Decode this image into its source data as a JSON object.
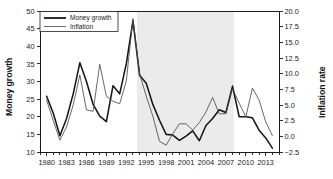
{
  "chart_data": {
    "type": "line",
    "title": "",
    "xlabel": "",
    "ylabel": "Money growth",
    "y2label": "Inflation rate",
    "grid": false,
    "legend_position": "top-left",
    "xlim": [
      1979,
      2015
    ],
    "ylim": [
      10,
      50
    ],
    "y2lim": [
      -2.5,
      20.0
    ],
    "ytick_labels": [
      "50",
      "45",
      "40",
      "35",
      "30",
      "25",
      "20",
      "15",
      "10"
    ],
    "ytick_values": [
      50,
      45,
      40,
      35,
      30,
      25,
      20,
      15,
      10
    ],
    "y2tick_labels": [
      "20.0",
      "17.5",
      "15.0",
      "12.5",
      "10.0",
      "7.5",
      "5.0",
      "2.5",
      "0.0",
      "−2.5"
    ],
    "y2tick_values": [
      20.0,
      17.5,
      15.0,
      12.5,
      10.0,
      7.5,
      5.0,
      2.5,
      0.0,
      -2.5
    ],
    "xtick_labels": [
      "1980",
      "1983",
      "1986",
      "1989",
      "1992",
      "1995",
      "1998",
      "2001",
      "2004",
      "2007",
      "2010",
      "2013"
    ],
    "xtick_values": [
      1980,
      1983,
      1986,
      1989,
      1992,
      1995,
      1998,
      2001,
      2004,
      2007,
      2010,
      2013
    ],
    "x_minor_from": 1979,
    "x_minor_to": 2015,
    "shaded_region": {
      "start": 1993.6,
      "end": 2008.2,
      "color": "#ebebeb"
    },
    "x": [
      1980,
      1981,
      1982,
      1983,
      1984,
      1985,
      1986,
      1987,
      1988,
      1989,
      1990,
      1991,
      1992,
      1993,
      1994,
      1995,
      1996,
      1997,
      1998,
      1999,
      2000,
      2001,
      2002,
      2003,
      2004,
      2005,
      2006,
      2007,
      2008,
      2009,
      2010,
      2011,
      2012,
      2013,
      2014
    ],
    "series": [
      {
        "name": "Money growth",
        "axis": "left",
        "color": "#161616",
        "width": "thick",
        "values": [
          25.8,
          21.0,
          14.6,
          19.5,
          26.5,
          35.3,
          30.0,
          23.5,
          20.2,
          18.6,
          28.8,
          26.5,
          35.0,
          47.2,
          31.8,
          29.5,
          23.5,
          19.0,
          15.0,
          14.8,
          13.3,
          14.5,
          16.0,
          13.2,
          17.5,
          19.5,
          22.0,
          21.2,
          28.7,
          20.0,
          20.0,
          19.7,
          16.2,
          14.0,
          11.1
        ]
      },
      {
        "name": "Inflation",
        "axis": "right",
        "color": "#4d4d4d",
        "width": "thin",
        "values": [
          5.8,
          2.5,
          -0.6,
          1.5,
          5.0,
          9.8,
          4.2,
          4.0,
          11.5,
          6.4,
          5.6,
          5.2,
          8.8,
          18.8,
          10.0,
          6.4,
          3.2,
          -0.8,
          -1.4,
          0.4,
          2.0,
          2.0,
          1.0,
          2.2,
          3.9,
          6.2,
          3.6,
          3.6,
          7.6,
          5.3,
          3.1,
          7.7,
          5.8,
          2.3,
          0.1
        ]
      }
    ]
  },
  "legend": {
    "items": [
      {
        "label": "Money growth",
        "style": "thick"
      },
      {
        "label": "Inflation",
        "style": "thin"
      }
    ]
  },
  "axes": {
    "left_title": "Money growth",
    "right_title": "Inflation rate"
  }
}
